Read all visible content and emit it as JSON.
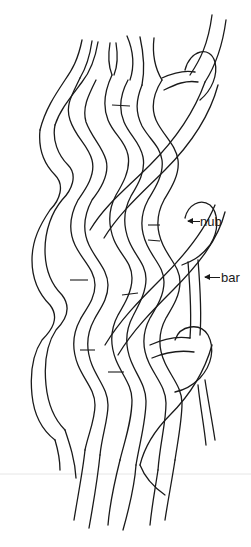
{
  "figure": {
    "type": "line-illustration",
    "stroke_color": "#1a1a1a",
    "background": "#ffffff"
  },
  "labels": {
    "nub": "nub",
    "bar": "bar"
  },
  "annotations": [
    {
      "text": "nub",
      "arrow": "left",
      "target": "outer loop on right side of braid"
    },
    {
      "text": "bar",
      "arrow": "left",
      "target": "vertical strand on right side of braid"
    }
  ]
}
